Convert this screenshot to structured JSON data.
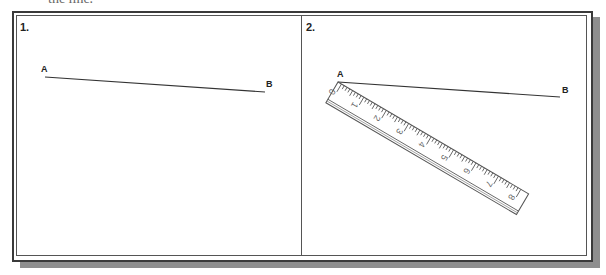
{
  "caption_fragment": "the line.",
  "panels": [
    {
      "label": "1.",
      "points": {
        "A": "A",
        "B": "B"
      },
      "line": {
        "x1": 45,
        "y1": 77,
        "x2": 265,
        "y2": 92
      }
    },
    {
      "label": "2.",
      "points": {
        "A": "A",
        "B": "B"
      },
      "line": {
        "x1": 338,
        "y1": 82,
        "x2": 560,
        "y2": 97
      },
      "ruler": {
        "numbers": [
          "0",
          "1",
          "2",
          "3",
          "4",
          "5",
          "6",
          "7",
          "8"
        ],
        "angle_deg": 30.4,
        "origin": {
          "x": 338,
          "y": 82
        }
      }
    }
  ],
  "colors": {
    "line": "#333333",
    "frame": "#3a3a3a",
    "shadow": "#8e8e8e",
    "ruler_ink": "#555555"
  }
}
